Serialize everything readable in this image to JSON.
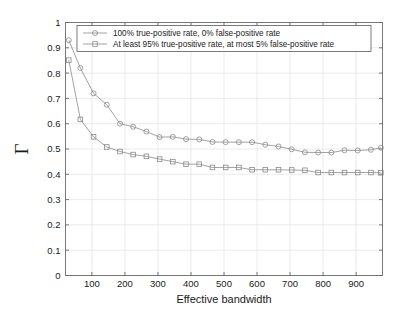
{
  "chart_data": {
    "type": "line",
    "title": "",
    "xlabel": "Effective bandwidth",
    "ylabel": "Γ",
    "xlim": [
      20,
      980
    ],
    "ylim": [
      0,
      1
    ],
    "grid": true,
    "legend_position": "top-center",
    "xticks": [
      100,
      200,
      300,
      400,
      500,
      600,
      700,
      800,
      900
    ],
    "yticks": [
      "0",
      "0.1",
      "0.2",
      "0.3",
      "0.4",
      "0.5",
      "0.6",
      "0.7",
      "0.8",
      "0.9",
      "1"
    ],
    "x": [
      30,
      65,
      105,
      145,
      185,
      225,
      265,
      305,
      345,
      385,
      425,
      465,
      505,
      545,
      585,
      625,
      665,
      705,
      745,
      785,
      825,
      865,
      905,
      945,
      975
    ],
    "series": [
      {
        "name": "100% true-positive rate, 0% false-positive rate",
        "marker": "circle",
        "color": "#8a8a8a",
        "values": [
          0.93,
          0.82,
          0.72,
          0.675,
          0.6,
          0.588,
          0.569,
          0.547,
          0.548,
          0.539,
          0.538,
          0.528,
          0.527,
          0.527,
          0.527,
          0.517,
          0.51,
          0.499,
          0.487,
          0.486,
          0.486,
          0.495,
          0.494,
          0.497,
          0.505
        ]
      },
      {
        "name": "At least 95% true-positive rate, at most 5% false-positive rate",
        "marker": "square",
        "color": "#8a8a8a",
        "values": [
          0.851,
          0.617,
          0.548,
          0.508,
          0.49,
          0.478,
          0.471,
          0.46,
          0.45,
          0.44,
          0.44,
          0.427,
          0.427,
          0.427,
          0.418,
          0.418,
          0.418,
          0.417,
          0.416,
          0.407,
          0.407,
          0.407,
          0.407,
          0.407,
          0.406
        ]
      }
    ]
  },
  "legend": {
    "entries": [
      {
        "label": "100% true-positive rate, 0% false-positive rate",
        "marker": "circle-marker-icon"
      },
      {
        "label": "At least 95% true-positive rate, at most 5% false-positive rate",
        "marker": "square-marker-icon"
      }
    ]
  },
  "colors": {
    "series": "#8a8a8a",
    "axis": "#6a6a6a",
    "grid": "#e2e2e2",
    "background": "#ffffff",
    "text": "#1a1a1a"
  }
}
